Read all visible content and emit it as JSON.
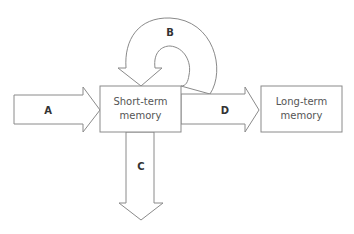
{
  "diagram": {
    "boxes": [
      {
        "id": "short-term",
        "line1": "Short-term",
        "line2": "memory"
      },
      {
        "id": "long-term",
        "line1": "Long-term",
        "line2": "memory"
      }
    ],
    "arrows": {
      "a": {
        "label": "A",
        "from": "input",
        "to": "short-term"
      },
      "b": {
        "label": "B",
        "from": "short-term",
        "to": "short-term"
      },
      "c": {
        "label": "C",
        "from": "short-term",
        "to": "output-down"
      },
      "d": {
        "label": "D",
        "from": "short-term",
        "to": "long-term"
      }
    },
    "colors": {
      "stroke": "#8a8a8a",
      "fill": "#ffffff",
      "text": "#555555"
    }
  }
}
